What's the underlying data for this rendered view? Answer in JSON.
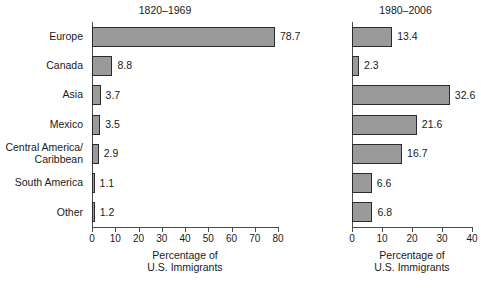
{
  "chart_data": {
    "type": "bar",
    "orientation": "horizontal",
    "title": "",
    "categories": [
      "Europe",
      "Canada",
      "Asia",
      "Mexico",
      "Central America/\nCaribbean",
      "South America",
      "Other"
    ],
    "panels": [
      {
        "title": "1820–1969",
        "xlabel": "Percentage of\nU.S. Immigrants",
        "ylabel": "",
        "xlim": [
          0,
          80
        ],
        "xticks": [
          0,
          10,
          20,
          30,
          40,
          50,
          60,
          70,
          80
        ],
        "xticklabels": [
          "0",
          "10",
          "20",
          "30",
          "40",
          "50",
          "60",
          "70",
          "80"
        ],
        "grid": false,
        "values": [
          78.7,
          8.8,
          3.7,
          3.5,
          2.9,
          1.1,
          1.2
        ],
        "value_labels": [
          "78.7",
          "8.8",
          "3.7",
          "3.5",
          "2.9",
          "1.1",
          "1.2"
        ]
      },
      {
        "title": "1980–2006",
        "xlabel": "Percentage of\nU.S. Immigrants",
        "ylabel": "",
        "xlim": [
          0,
          40
        ],
        "xticks": [
          0,
          10,
          20,
          30,
          40
        ],
        "xticklabels": [
          "0",
          "10",
          "20",
          "30",
          "40"
        ],
        "grid": false,
        "values": [
          13.4,
          2.3,
          32.6,
          21.6,
          16.7,
          6.6,
          6.8
        ],
        "value_labels": [
          "13.4",
          "2.3",
          "32.6",
          "21.6",
          "16.7",
          "6.6",
          "6.8"
        ]
      }
    ],
    "legend": null,
    "colors": {
      "bar_fill": "#9a9a9a",
      "bar_edge": "#2b2b2b",
      "axis": "#4a4a4a",
      "text": "#1a1a1a",
      "background": "#ffffff"
    }
  }
}
